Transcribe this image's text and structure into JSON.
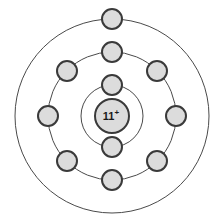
{
  "diagram": {
    "element_symbol_shown": false,
    "background_color": "#ffffff",
    "center": {
      "x": 112,
      "y": 116
    },
    "nucleus": {
      "label": "11",
      "charge_superscript": "+",
      "radius": 17,
      "fill": "#dcdcdc",
      "stroke": "#3a3a3a",
      "stroke_width": 2,
      "font_size": 11,
      "text_color": "#1a1a1a"
    },
    "shells": [
      {
        "name": "shell-1",
        "radius": 31,
        "stroke": "#4a4a4a",
        "stroke_width": 1,
        "electron_count": 2
      },
      {
        "name": "shell-2",
        "radius": 64,
        "stroke": "#4a4a4a",
        "stroke_width": 1,
        "electron_count": 8
      },
      {
        "name": "shell-3",
        "radius": 97,
        "stroke": "#4a4a4a",
        "stroke_width": 1,
        "electron_count": 1
      }
    ],
    "electron_style": {
      "radius": 10,
      "fill": "#dcdcdc",
      "stroke": "#3a3a3a",
      "stroke_width": 2
    },
    "electrons": [
      {
        "shell": 1,
        "index": 0,
        "angle_deg": 270,
        "cx": 112,
        "cy": 85
      },
      {
        "shell": 1,
        "index": 1,
        "angle_deg": 90,
        "cx": 112,
        "cy": 147
      },
      {
        "shell": 2,
        "index": 0,
        "angle_deg": 270,
        "cx": 112,
        "cy": 52
      },
      {
        "shell": 2,
        "index": 1,
        "angle_deg": 315,
        "cx": 157,
        "cy": 71
      },
      {
        "shell": 2,
        "index": 2,
        "angle_deg": 0,
        "cx": 176,
        "cy": 116
      },
      {
        "shell": 2,
        "index": 3,
        "angle_deg": 45,
        "cx": 157,
        "cy": 161
      },
      {
        "shell": 2,
        "index": 4,
        "angle_deg": 90,
        "cx": 112,
        "cy": 180
      },
      {
        "shell": 2,
        "index": 5,
        "angle_deg": 135,
        "cx": 67,
        "cy": 161
      },
      {
        "shell": 2,
        "index": 6,
        "angle_deg": 180,
        "cx": 48,
        "cy": 116
      },
      {
        "shell": 2,
        "index": 7,
        "angle_deg": 225,
        "cx": 67,
        "cy": 71
      },
      {
        "shell": 3,
        "index": 0,
        "angle_deg": 270,
        "cx": 112,
        "cy": 19
      }
    ]
  }
}
